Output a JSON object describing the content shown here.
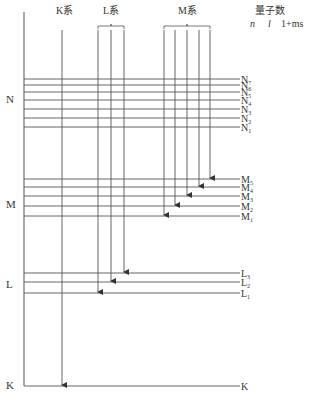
{
  "header": {
    "series": [
      {
        "label": "K系",
        "x": 62
      },
      {
        "label": "L系",
        "x": 111
      },
      {
        "label": "M系",
        "x": 187
      }
    ],
    "quantum_numbers": {
      "title": "量子数",
      "columns": [
        "n",
        "l",
        "1+ms"
      ]
    }
  },
  "shells": [
    {
      "label": "N",
      "label_y": 103,
      "levels": [
        {
          "label": "N",
          "sub": "7",
          "y": 79
        },
        {
          "label": "N",
          "sub": "6",
          "y": 85
        },
        {
          "label": "N",
          "sub": "5",
          "y": 92
        },
        {
          "label": "N",
          "sub": "4",
          "y": 100
        },
        {
          "label": "N",
          "sub": "3",
          "y": 109
        },
        {
          "label": "N",
          "sub": "2",
          "y": 118
        },
        {
          "label": "N",
          "sub": "1",
          "y": 127
        }
      ]
    },
    {
      "label": "M",
      "label_y": 208,
      "levels": [
        {
          "label": "M",
          "sub": "5",
          "y": 179
        },
        {
          "label": "M",
          "sub": "4",
          "y": 187
        },
        {
          "label": "M",
          "sub": "3",
          "y": 196
        },
        {
          "label": "M",
          "sub": "2",
          "y": 206
        },
        {
          "label": "M",
          "sub": "1",
          "y": 216
        }
      ]
    },
    {
      "label": "L",
      "label_y": 288,
      "levels": [
        {
          "label": "L",
          "sub": "3",
          "y": 273
        },
        {
          "label": "L",
          "sub": "2",
          "y": 282
        },
        {
          "label": "L",
          "sub": "1",
          "y": 293
        }
      ]
    },
    {
      "label": "K",
      "label_y": 389,
      "levels": [
        {
          "label": "K",
          "sub": "",
          "y": 386
        }
      ]
    }
  ],
  "transitions": [
    {
      "series": "K",
      "x": 62,
      "y_start": 30,
      "y_end": 386
    },
    {
      "series": "L",
      "x": 98,
      "y_start": 30,
      "y_end": 293
    },
    {
      "series": "L",
      "x": 111,
      "y_start": 30,
      "y_end": 282
    },
    {
      "series": "L",
      "x": 124,
      "y_start": 30,
      "y_end": 273
    },
    {
      "series": "M",
      "x": 164,
      "y_start": 30,
      "y_end": 216
    },
    {
      "series": "M",
      "x": 175,
      "y_start": 30,
      "y_end": 206
    },
    {
      "series": "M",
      "x": 187,
      "y_start": 30,
      "y_end": 196
    },
    {
      "series": "M",
      "x": 199,
      "y_start": 30,
      "y_end": 187
    },
    {
      "series": "M",
      "x": 210,
      "y_start": 30,
      "y_end": 179
    }
  ],
  "caption": "图 ——  原子的内层能级跃迁产生X射线谱线示意图"
}
